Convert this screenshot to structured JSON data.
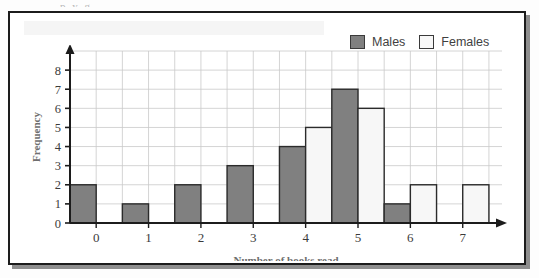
{
  "figure": {
    "frame_border_color": "#1c1c1c",
    "shadow_color": "#8e8e8e",
    "clipped_text_above": "p y g"
  },
  "legend": {
    "position": "top-right",
    "items": [
      {
        "label": "Males",
        "swatch": "males-swatch",
        "color": "#808080"
      },
      {
        "label": "Females",
        "swatch": "females-swatch",
        "color": "#f7f7f7"
      }
    ]
  },
  "axes": {
    "x_title": "Number of books read",
    "y_title": "Frequency",
    "x_ticks": [
      "0",
      "1",
      "2",
      "3",
      "4",
      "5",
      "6",
      "7"
    ],
    "y_ticks": [
      "0",
      "1",
      "2",
      "3",
      "4",
      "5",
      "6",
      "7",
      "8"
    ],
    "grid": "on",
    "grid_color": "#c9c9c9",
    "axis_color": "#1c1c1c"
  },
  "chart_data": {
    "type": "bar",
    "title": "",
    "subtitle": "",
    "xlabel": "Number of books read",
    "ylabel": "Frequency",
    "categories": [
      "0",
      "1",
      "2",
      "3",
      "4",
      "5",
      "6",
      "7"
    ],
    "series": [
      {
        "name": "Males",
        "color": "#808080",
        "values": [
          2,
          1,
          2,
          3,
          4,
          7,
          1,
          0
        ]
      },
      {
        "name": "Females",
        "color": "#f7f7f7",
        "values": [
          0,
          0,
          0,
          0,
          5,
          6,
          2,
          2
        ]
      }
    ],
    "xlim": [
      -0.5,
      7.75
    ],
    "ylim": [
      0,
      9
    ],
    "y_major_step": 1,
    "x_major_step": 1,
    "grid": true,
    "legend_position": "top-right"
  }
}
